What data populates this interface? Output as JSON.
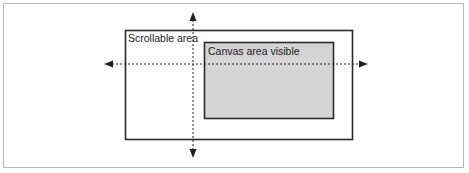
{
  "diagram": {
    "outer_label": "Scrollable area",
    "inner_label": "Canvas area visible",
    "colors": {
      "frame_border": "#b8b8b8",
      "rect_stroke": "#2a2a2a",
      "inner_fill": "#d4d4d4",
      "arrow": "#222222"
    },
    "arrows": {
      "horizontal": "bidirectional dotted arrow",
      "vertical": "bidirectional dotted arrow"
    }
  }
}
